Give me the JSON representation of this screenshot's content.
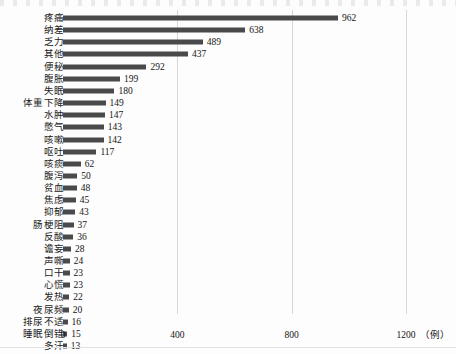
{
  "chart_data": {
    "type": "bar",
    "orientation": "horizontal",
    "title": "",
    "xlabel": "（例）",
    "ylabel": "",
    "xlim": [
      0,
      1200
    ],
    "xticks": [
      0,
      400,
      800,
      1200
    ],
    "xtick_labels": [
      "0",
      "400",
      "800",
      "1200"
    ],
    "grid": true,
    "grid_axis": "x",
    "legend": false,
    "bar_color": "#4a4a4c",
    "categories": [
      "疼痛",
      "纳差",
      "乏力",
      "其他",
      "便秘",
      "腹胀",
      "失眠",
      "体重下降",
      "水肿",
      "憋气",
      "咳嗽",
      "呕吐",
      "咳痰",
      "腹泻",
      "贫血",
      "焦虑",
      "抑郁",
      "肠梗阻",
      "反酸",
      "谵妄",
      "声嘶",
      "口干",
      "心慌",
      "发热",
      "夜尿频",
      "排尿不适",
      "睡眠倒错",
      "多汗"
    ],
    "values": [
      962,
      638,
      489,
      437,
      292,
      199,
      180,
      149,
      147,
      143,
      142,
      117,
      62,
      50,
      48,
      45,
      43,
      37,
      36,
      28,
      24,
      23,
      23,
      22,
      20,
      16,
      15,
      13
    ],
    "value_labels": [
      "962",
      "638",
      "489",
      "437",
      "292",
      "199",
      "180",
      "149",
      "147",
      "143",
      "142",
      "117",
      "62",
      "50",
      "48",
      "45",
      "43",
      "37",
      "36",
      "28",
      "24",
      "23",
      "23",
      "22",
      "20",
      "16",
      "15",
      "13"
    ]
  },
  "axis": {
    "unit_suffix": "（例）"
  }
}
